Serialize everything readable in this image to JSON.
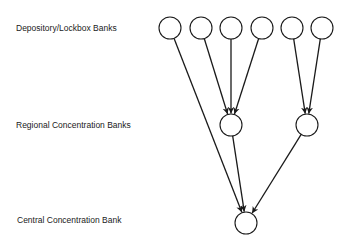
{
  "labels": {
    "tier1": "Depository/Lockbox Banks",
    "tier2": "Regional Concentration Banks",
    "tier3": "Central Concentration Bank"
  },
  "colors": {
    "stroke": "#1a1a1a",
    "background": "#ffffff"
  },
  "nodes": {
    "depository": [
      {
        "id": "d1",
        "cx": 170,
        "cy": 28
      },
      {
        "id": "d2",
        "cx": 201,
        "cy": 28
      },
      {
        "id": "d3",
        "cx": 231,
        "cy": 28
      },
      {
        "id": "d4",
        "cx": 262,
        "cy": 28
      },
      {
        "id": "d5",
        "cx": 292,
        "cy": 28
      },
      {
        "id": "d6",
        "cx": 322,
        "cy": 28
      }
    ],
    "regional": [
      {
        "id": "r1",
        "cx": 231,
        "cy": 125
      },
      {
        "id": "r2",
        "cx": 307,
        "cy": 125
      }
    ],
    "central": [
      {
        "id": "c1",
        "cx": 246,
        "cy": 223
      }
    ]
  },
  "edges": [
    {
      "from": "d1",
      "to": "c1"
    },
    {
      "from": "d2",
      "to": "r1"
    },
    {
      "from": "d3",
      "to": "r1"
    },
    {
      "from": "d4",
      "to": "r1"
    },
    {
      "from": "d5",
      "to": "r2"
    },
    {
      "from": "d6",
      "to": "r2"
    },
    {
      "from": "r1",
      "to": "c1"
    },
    {
      "from": "r2",
      "to": "c1"
    }
  ]
}
